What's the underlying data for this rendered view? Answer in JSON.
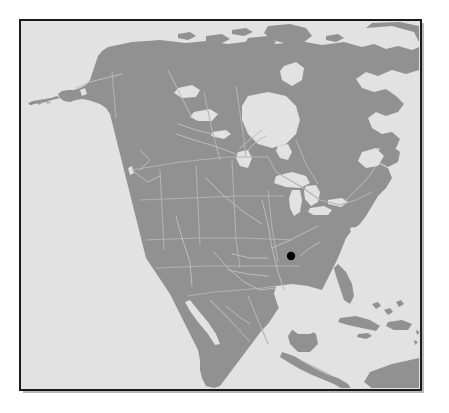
{
  "figure": {
    "type": "locator-map",
    "caption": "",
    "canvas": {
      "width": 449,
      "height": 413
    },
    "background_color": "#ffffff"
  },
  "frame": {
    "name": "map-border-frame",
    "x": 20,
    "y": 20,
    "width": 401,
    "height": 370,
    "border_color": "#1a1a1a",
    "border_width": 2,
    "shadow_color": "#b8b8b8",
    "inner_edge_color": "#6e6e6e"
  },
  "map": {
    "region_name": "North America",
    "projection": "lambert-conformal-conic",
    "ocean_color": "#e2e2e2",
    "land_color": "#919191",
    "lake_color": "#e2e2e2",
    "border_line_color": "#a8a8a8",
    "river_line_color": "#b0b0b0",
    "extent": {
      "x": 22,
      "y": 22,
      "width": 397,
      "height": 366
    }
  },
  "markers": [
    {
      "name": "site-location-marker",
      "label": "",
      "x": 291,
      "y": 256,
      "radius": 4.2,
      "color": "#000000"
    }
  ],
  "labels": [],
  "legend": {
    "visible": false,
    "entries": []
  }
}
